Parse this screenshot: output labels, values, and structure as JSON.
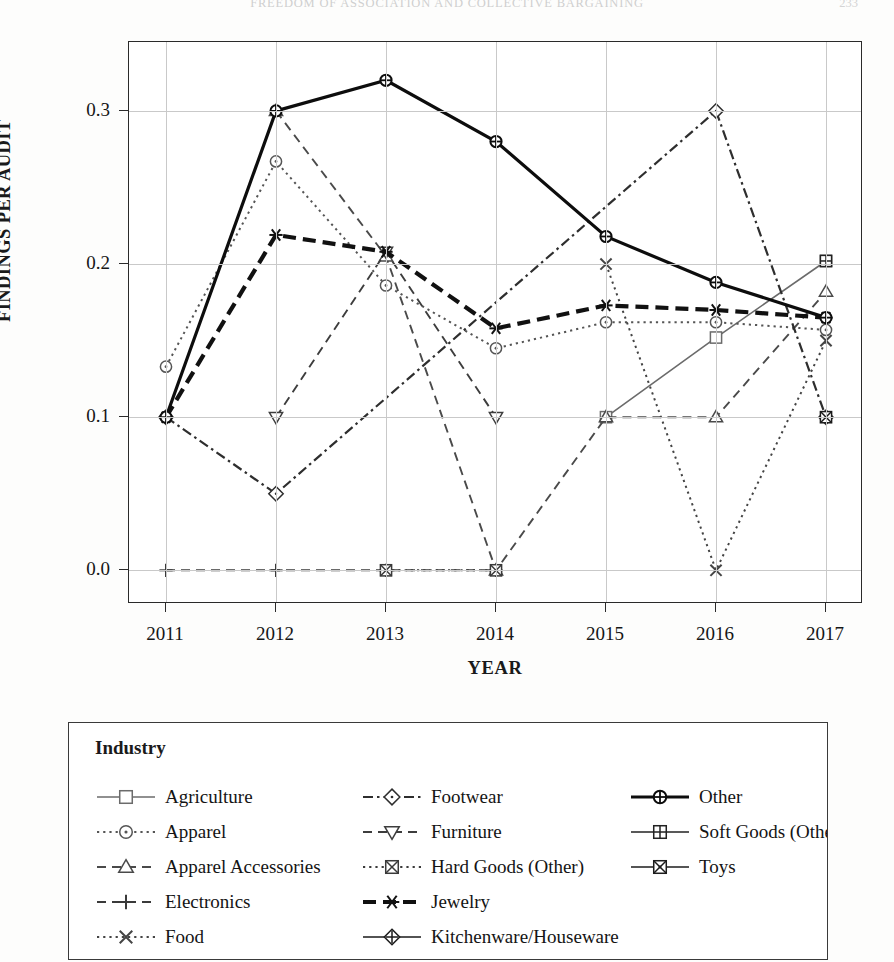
{
  "running_head": "FREEDOM OF ASSOCIATION AND COLLECTIVE BARGAINING",
  "folio": "233",
  "axis": {
    "y_title": "FINDINGS PER AUDIT",
    "x_title": "YEAR",
    "y_ticks": [
      "0.0",
      "0.1",
      "0.2",
      "0.3"
    ],
    "x_ticks": [
      "2011",
      "2012",
      "2013",
      "2014",
      "2015",
      "2016",
      "2017"
    ]
  },
  "legend": {
    "title": "Industry",
    "columns": [
      [
        "Agriculture",
        "Apparel",
        "Apparel Accessories",
        "Electronics",
        "Food"
      ],
      [
        "Footwear",
        "Furniture",
        "Hard Goods (Other)",
        "Jewelry",
        "Kitchenware/Houseware"
      ],
      [
        "Other",
        "Soft Goods (Other)",
        "Toys"
      ]
    ]
  },
  "chart_data": {
    "type": "line",
    "title": "",
    "xlabel": "YEAR",
    "ylabel": "FINDINGS PER AUDIT",
    "x": [
      2011,
      2012,
      2013,
      2014,
      2015,
      2016,
      2017
    ],
    "ylim": [
      -0.022,
      0.345
    ],
    "yticks": [
      0.0,
      0.1,
      0.2,
      0.3
    ],
    "grid": true,
    "legend_position": "below-plot",
    "series": [
      {
        "name": "Agriculture",
        "marker": "square",
        "dash": "solid",
        "color": "#6b6b6b",
        "x": [
          2015,
          2016,
          2017
        ],
        "values": [
          0.1,
          0.152,
          0.202
        ]
      },
      {
        "name": "Apparel",
        "marker": "circle",
        "dash": "dotted",
        "color": "#555555",
        "x": [
          2011,
          2012,
          2013,
          2014,
          2015,
          2016,
          2017
        ],
        "values": [
          0.133,
          0.267,
          0.186,
          0.145,
          0.162,
          0.162,
          0.157
        ]
      },
      {
        "name": "Apparel Accessories",
        "marker": "triangle-up",
        "dash": "dashed",
        "color": "#4a4a4a",
        "x": [
          2012,
          2013,
          2014,
          2015,
          2016,
          2017
        ],
        "values": [
          0.3,
          0.205,
          0.0,
          0.1,
          0.1,
          0.182
        ]
      },
      {
        "name": "Electronics",
        "marker": "plus",
        "dash": "dashed",
        "color": "#3a3a3a",
        "x": [
          2011,
          2012,
          2013,
          2014
        ],
        "values": [
          0.0,
          0.0,
          0.0,
          0.0
        ]
      },
      {
        "name": "Food",
        "marker": "x",
        "dash": "dotted",
        "color": "#444444",
        "x": [
          2015,
          2016,
          2017
        ],
        "values": [
          0.2,
          0.0,
          0.15
        ]
      },
      {
        "name": "Footwear",
        "marker": "diamond",
        "dash": "dash-dot",
        "color": "#2e2e2e",
        "x": [
          2011,
          2012,
          2016,
          2017
        ],
        "values": [
          0.1,
          0.05,
          0.3,
          0.1
        ]
      },
      {
        "name": "Furniture",
        "marker": "triangle-down",
        "dash": "dashed",
        "color": "#3d3d3d",
        "x": [
          2012,
          2013,
          2014
        ],
        "values": [
          0.1,
          0.208,
          0.1
        ]
      },
      {
        "name": "Hard Goods (Other)",
        "marker": "square-x",
        "dash": "dotted",
        "color": "#3a3a3a",
        "x": [
          2013,
          2014
        ],
        "values": [
          0.0,
          0.0
        ]
      },
      {
        "name": "Jewelry",
        "marker": "asterisk",
        "dash": "thick-dash",
        "color": "#111111",
        "x": [
          2011,
          2012,
          2013,
          2014,
          2015,
          2016,
          2017
        ],
        "values": [
          0.1,
          0.219,
          0.208,
          0.158,
          0.173,
          0.17,
          0.165
        ]
      },
      {
        "name": "Kitchenware/Houseware",
        "marker": "diamond-plus",
        "dash": "solid",
        "color": "#1a1a1a",
        "x": [],
        "values": []
      },
      {
        "name": "Other",
        "marker": "circle-plus",
        "dash": "solid-thick",
        "color": "#0d0d0d",
        "x": [
          2011,
          2012,
          2013,
          2014,
          2015,
          2016,
          2017
        ],
        "values": [
          0.1,
          0.3,
          0.32,
          0.28,
          0.218,
          0.188,
          0.165
        ]
      },
      {
        "name": "Soft Goods (Other)",
        "marker": "square-plus",
        "dash": "solid",
        "color": "#222222",
        "x": [
          2017
        ],
        "values": [
          0.202
        ]
      },
      {
        "name": "Toys",
        "marker": "square-cross",
        "dash": "solid",
        "color": "#1c1c1c",
        "x": [
          2017
        ],
        "values": [
          0.1
        ]
      }
    ]
  }
}
